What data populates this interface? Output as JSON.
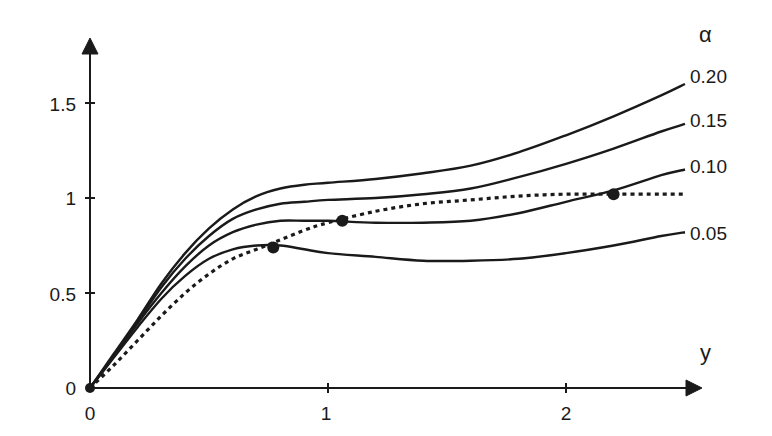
{
  "chart_data": {
    "type": "line",
    "title": "",
    "xlabel": "y",
    "ylabel": "",
    "legend_title": "α",
    "xlim": [
      0,
      2.5
    ],
    "ylim": [
      0,
      1.8
    ],
    "x_ticks": [
      "0",
      "1",
      "2"
    ],
    "y_ticks": [
      "0",
      "0.5",
      "1",
      "1.5"
    ],
    "grid": false,
    "legend_position": "right, inline labels at curve ends",
    "x": [
      0,
      0.1,
      0.2,
      0.3,
      0.4,
      0.5,
      0.6,
      0.7,
      0.8,
      0.9,
      1.0,
      1.2,
      1.4,
      1.6,
      1.8,
      2.0,
      2.2,
      2.4,
      2.5
    ],
    "series": [
      {
        "name": "0.20",
        "style": "solid",
        "values": [
          0,
          0.18,
          0.36,
          0.55,
          0.71,
          0.84,
          0.94,
          1.01,
          1.05,
          1.07,
          1.08,
          1.1,
          1.13,
          1.17,
          1.24,
          1.33,
          1.43,
          1.54,
          1.6
        ]
      },
      {
        "name": "0.15",
        "style": "solid",
        "values": [
          0,
          0.17,
          0.35,
          0.53,
          0.68,
          0.8,
          0.89,
          0.94,
          0.97,
          0.98,
          0.99,
          1.0,
          1.02,
          1.05,
          1.11,
          1.18,
          1.26,
          1.35,
          1.39
        ]
      },
      {
        "name": "0.10",
        "style": "solid",
        "values": [
          0,
          0.17,
          0.34,
          0.5,
          0.64,
          0.75,
          0.82,
          0.86,
          0.88,
          0.88,
          0.88,
          0.87,
          0.87,
          0.88,
          0.92,
          0.98,
          1.04,
          1.12,
          1.15
        ]
      },
      {
        "name": "0.05",
        "style": "solid",
        "values": [
          0,
          0.16,
          0.32,
          0.47,
          0.59,
          0.68,
          0.73,
          0.75,
          0.75,
          0.73,
          0.71,
          0.69,
          0.67,
          0.67,
          0.68,
          0.71,
          0.75,
          0.8,
          0.82
        ]
      },
      {
        "name": "envelope",
        "style": "dotted",
        "values": [
          0,
          0.12,
          0.25,
          0.38,
          0.5,
          0.6,
          0.68,
          0.73,
          0.78,
          0.83,
          0.87,
          0.93,
          0.97,
          0.99,
          1.01,
          1.02,
          1.02,
          1.02,
          1.02
        ]
      }
    ],
    "markers": [
      {
        "x": 0,
        "y": 0
      },
      {
        "x": 0.77,
        "y": 0.74
      },
      {
        "x": 1.06,
        "y": 0.88
      },
      {
        "x": 2.2,
        "y": 1.02
      }
    ]
  },
  "labels": {
    "y_ticks": [
      "0",
      "0.5",
      "1",
      "1.5"
    ],
    "x_ticks": [
      "0",
      "1",
      "2"
    ],
    "x_axis_title": "y",
    "legend_title": "α",
    "series": [
      "0.20",
      "0.15",
      "0.10",
      "0.05"
    ]
  }
}
